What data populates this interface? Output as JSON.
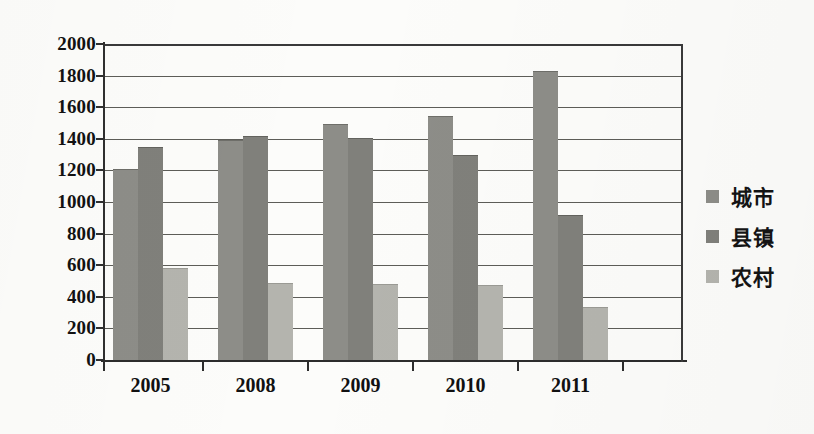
{
  "chart_data": {
    "type": "bar",
    "title": "",
    "subtitle": "",
    "xlabel": "",
    "ylabel": "",
    "categories": [
      "2005",
      "2008",
      "2009",
      "2010",
      "2011"
    ],
    "series": [
      {
        "name": "城市",
        "color": "#8d8d88",
        "values": [
          1210,
          1395,
          1495,
          1545,
          1830
        ]
      },
      {
        "name": "县镇",
        "color": "#80807b",
        "values": [
          1350,
          1420,
          1405,
          1300,
          920
        ]
      },
      {
        "name": "农村",
        "color": "#b4b4ae",
        "values": [
          585,
          490,
          480,
          475,
          335
        ]
      }
    ],
    "ylim": [
      0,
      2000
    ],
    "yticks": [
      0,
      200,
      400,
      600,
      800,
      1000,
      1200,
      1400,
      1600,
      1800,
      2000
    ],
    "ytick_labels": [
      "0",
      "200",
      "400",
      "600",
      "800",
      "1000",
      "1200",
      "1400",
      "1600",
      "1800",
      "2000"
    ],
    "grid": true,
    "grid_axis": "y",
    "legend_position": "right",
    "legend": [
      "城市",
      "县镇",
      "农村"
    ]
  }
}
